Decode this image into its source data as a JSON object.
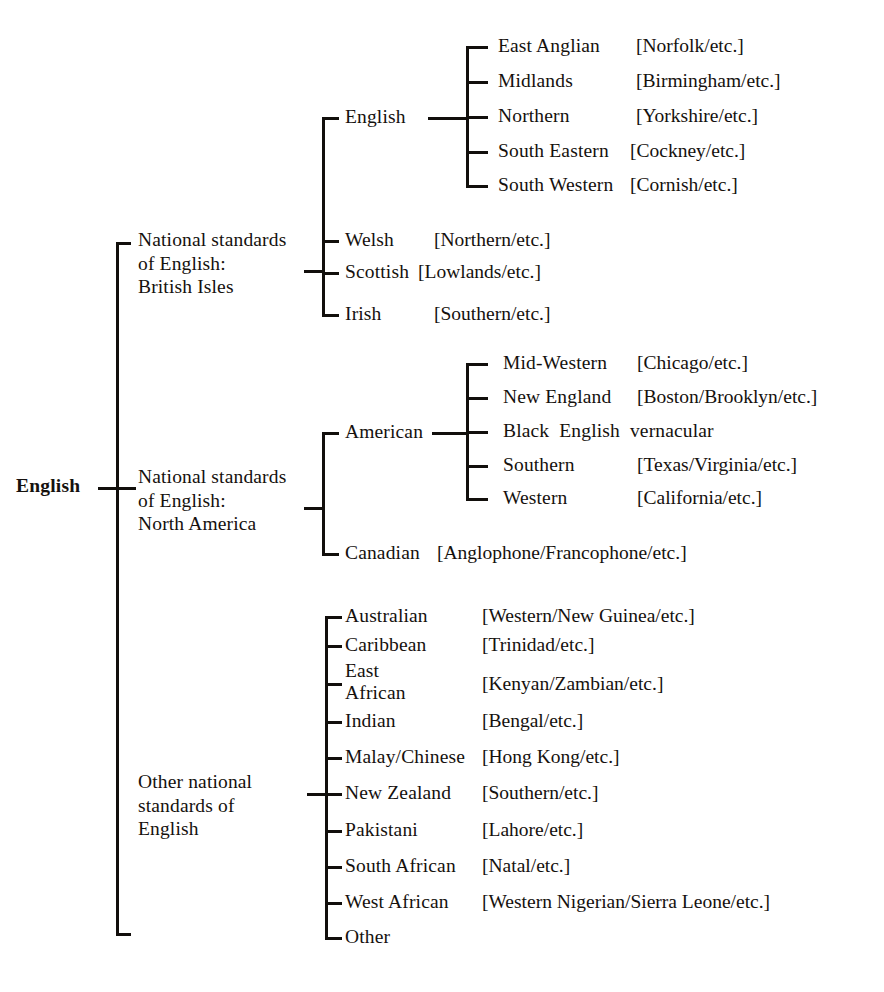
{
  "diagram": {
    "title": "English",
    "root": {
      "label": "English"
    },
    "branches": [
      {
        "id": "british-isles",
        "label": "National standards\nof English:\nBritish Isles",
        "children": [
          {
            "label": "English",
            "gloss": "",
            "has_subtree": true,
            "subchildren": [
              {
                "label": "East Anglian",
                "gloss": "[Norfolk/etc.]"
              },
              {
                "label": "Midlands",
                "gloss": "[Birmingham/etc.]"
              },
              {
                "label": "Northern",
                "gloss": "[Yorkshire/etc.]"
              },
              {
                "label": "South Eastern",
                "gloss": "[Cockney/etc.]"
              },
              {
                "label": "South Western",
                "gloss": "[Cornish/etc.]"
              }
            ]
          },
          {
            "label": "Welsh",
            "gloss": "[Northern/etc.]",
            "has_subtree": false
          },
          {
            "label": "Scottish",
            "gloss": "[Lowlands/etc.]",
            "has_subtree": false
          },
          {
            "label": "Irish",
            "gloss": "[Southern/etc.]",
            "has_subtree": false
          }
        ]
      },
      {
        "id": "north-america",
        "label": "National standards\nof English:\nNorth America",
        "children": [
          {
            "label": "American",
            "gloss": "",
            "has_subtree": true,
            "subchildren": [
              {
                "label": "Mid-Western",
                "gloss": "[Chicago/etc.]"
              },
              {
                "label": "New England",
                "gloss": "[Boston/Brooklyn/etc.]"
              },
              {
                "label": "Black  English  vernacular",
                "gloss": ""
              },
              {
                "label": "Southern",
                "gloss": "[Texas/Virginia/etc.]"
              },
              {
                "label": "Western",
                "gloss": "[California/etc.]"
              }
            ]
          },
          {
            "label": "Canadian",
            "gloss": "[Anglophone/Francophone/etc.]",
            "has_subtree": false
          }
        ]
      },
      {
        "id": "other-national",
        "label": "Other national\nstandards of\nEnglish",
        "children": [
          {
            "label": "Australian",
            "gloss": "[Western/New Guinea/etc.]"
          },
          {
            "label": "Caribbean",
            "gloss": "[Trinidad/etc.]"
          },
          {
            "label": "East\nAfrican",
            "gloss": "[Kenyan/Zambian/etc.]"
          },
          {
            "label": "Indian",
            "gloss": "[Bengal/etc.]"
          },
          {
            "label": "Malay/Chinese",
            "gloss": "[Hong Kong/etc.]"
          },
          {
            "label": "New Zealand",
            "gloss": "[Southern/etc.]"
          },
          {
            "label": "Pakistani",
            "gloss": "[Lahore/etc.]"
          },
          {
            "label": "South African",
            "gloss": "[Natal/etc.]"
          },
          {
            "label": "West African",
            "gloss": "[Western Nigerian/Sierra Leone/etc.]"
          },
          {
            "label": "Other",
            "gloss": ""
          }
        ]
      }
    ]
  },
  "style": {
    "ink": "#15110e",
    "paper": "#ffffff"
  }
}
